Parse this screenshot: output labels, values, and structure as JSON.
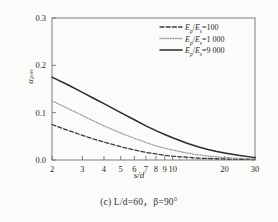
{
  "figure": {
    "caption_prefix": "(c)",
    "caption_text": "L/d=60，β=90°",
    "caption_full": "(c) L/d=60，β=90°"
  },
  "chart_data": {
    "type": "line",
    "title": "",
    "xlabel": "s/d",
    "ylabel": "αₚₘ",
    "ylabel_plain": "a_pM",
    "xscale": "log",
    "yscale": "linear",
    "xlim": [
      2,
      30
    ],
    "ylim": [
      0.0,
      0.3
    ],
    "grid": false,
    "legend_position": "top-right",
    "xticks": [
      2,
      3,
      4,
      5,
      6,
      7,
      8,
      9,
      10,
      20,
      30
    ],
    "xtick_labels": [
      "2",
      "3",
      "4",
      "5",
      "6",
      "7",
      "8",
      "9",
      "10",
      "20",
      "30"
    ],
    "yticks": [
      0.0,
      0.1,
      0.2,
      0.3
    ],
    "ytick_labels": [
      "0.0",
      "0.1",
      "0.2",
      "0.3"
    ],
    "x": [
      2,
      2.5,
      3,
      3.5,
      4,
      5,
      6,
      7,
      8,
      9,
      10,
      12,
      14,
      16,
      18,
      20,
      24,
      30
    ],
    "series": [
      {
        "name": "Ep/Es=100",
        "label": "Eₚ/Eₛ=100",
        "label_num": "100",
        "style": "dashed",
        "color": "#3a3a3a",
        "values": [
          0.075,
          0.062,
          0.052,
          0.044,
          0.038,
          0.028,
          0.021,
          0.016,
          0.013,
          0.01,
          0.008,
          0.006,
          0.004,
          0.0032,
          0.0026,
          0.0022,
          0.0016,
          0.001
        ]
      },
      {
        "name": "Ep/Es=1 000",
        "label": "Eₚ/Eₛ=1 000",
        "label_num": "1 000",
        "style": "dotted",
        "color": "#9a9a9a",
        "values": [
          0.125,
          0.108,
          0.094,
          0.082,
          0.072,
          0.057,
          0.046,
          0.037,
          0.03,
          0.025,
          0.021,
          0.015,
          0.011,
          0.0085,
          0.0066,
          0.0053,
          0.0036,
          0.002
        ]
      },
      {
        "name": "Ep/Es=9 000",
        "label": "Eₚ/Eₛ=9 000",
        "label_num": "9 000",
        "style": "solid",
        "color": "#2b2b2b",
        "values": [
          0.175,
          0.158,
          0.143,
          0.13,
          0.119,
          0.1,
          0.085,
          0.072,
          0.062,
          0.054,
          0.047,
          0.036,
          0.028,
          0.022,
          0.018,
          0.015,
          0.01,
          0.005
        ]
      }
    ]
  }
}
